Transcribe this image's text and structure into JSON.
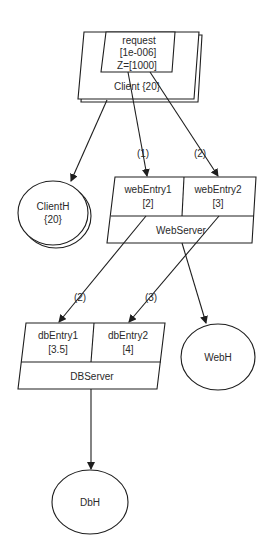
{
  "diagram": {
    "type": "layered-queueing-network",
    "colors": {
      "background": "#ffffff",
      "stroke": "#1e1e1e",
      "text": "#2a2a2a"
    },
    "tasks": {
      "client": {
        "name": "Client {20}",
        "multiplicity": "20",
        "entry": {
          "name": "request",
          "service_time": "[1e-006]",
          "think_time": "Z=[1000]"
        }
      },
      "webserver": {
        "name": "WebServer",
        "entries": [
          {
            "name": "webEntry1",
            "service_time": "[2]"
          },
          {
            "name": "webEntry2",
            "service_time": "[3]"
          }
        ]
      },
      "dbserver": {
        "name": "DBServer",
        "entries": [
          {
            "name": "dbEntry1",
            "service_time": "[3.5]"
          },
          {
            "name": "dbEntry2",
            "service_time": "[4]"
          }
        ]
      }
    },
    "processors": {
      "clienth": {
        "name": "ClientH",
        "multiplicity": "{20}"
      },
      "webh": {
        "name": "WebH"
      },
      "dbh": {
        "name": "DbH"
      }
    },
    "calls": [
      {
        "from": "request",
        "to": "webEntry1",
        "label": "(1)"
      },
      {
        "from": "request",
        "to": "webEntry2",
        "label": "(2)"
      },
      {
        "from": "webEntry1",
        "to": "dbEntry1",
        "label": "(2)"
      },
      {
        "from": "webEntry2",
        "to": "dbEntry2",
        "label": "(3)"
      }
    ],
    "allocations": [
      {
        "from": "Client",
        "to": "ClientH"
      },
      {
        "from": "WebServer",
        "to": "WebH"
      },
      {
        "from": "DBServer",
        "to": "DbH"
      }
    ]
  }
}
